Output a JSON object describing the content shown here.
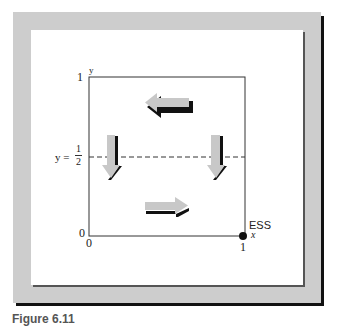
{
  "figure": {
    "frame_color": "#cdcdcd",
    "panel_color": "#ffffff",
    "arrow_fill": "#c8c8c8",
    "arrow_shadow": "#111111",
    "caption": "Figure 6.11"
  },
  "axes": {
    "y_axis_label": "y",
    "x_axis_label": "x",
    "y_top_tick": "1",
    "y_origin_tick": "0",
    "x_origin_tick": "0",
    "x_right_tick": "1"
  },
  "threshold": {
    "label_prefix": "y =",
    "numerator": "1",
    "denominator": "2",
    "style": "dashed"
  },
  "equilibrium": {
    "label": "ESS",
    "point": [
      1,
      0
    ]
  },
  "arrows": [
    {
      "name": "top-arrow",
      "direction": "left",
      "region": "y > 1/2, center"
    },
    {
      "name": "left-arrow",
      "direction": "down",
      "region": "x near 0"
    },
    {
      "name": "right-arrow",
      "direction": "down",
      "region": "x near 1"
    },
    {
      "name": "bottom-arrow",
      "direction": "right",
      "region": "y < 1/2, center"
    }
  ]
}
